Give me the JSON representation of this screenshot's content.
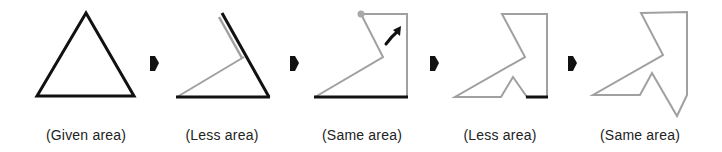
{
  "colors": {
    "black_edge": "#111111",
    "gray_edge": "#a0a0a0",
    "dot": "#a8a8a8",
    "text": "#222222"
  },
  "steps": [
    {
      "label": "(Given area)",
      "shape": "triangle"
    },
    {
      "label": "(Less area)",
      "shape": "triangle-cut"
    },
    {
      "label": "(Same area)",
      "shape": "rotated-flap"
    },
    {
      "label": "(Less area)",
      "shape": "notched"
    },
    {
      "label": "(Same area)",
      "shape": "final-polygon"
    }
  ],
  "arrows": [
    {
      "icon": "right-arrow-icon"
    },
    {
      "icon": "right-arrow-icon"
    },
    {
      "icon": "right-arrow-icon"
    },
    {
      "icon": "right-arrow-icon"
    }
  ],
  "annotations": {
    "rotation_icon": "curved-arrow-icon",
    "pivot_icon": "pivot-dot-icon"
  }
}
